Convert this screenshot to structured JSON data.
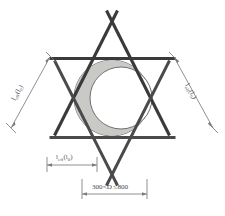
{
  "figure": {
    "background_color": "#ffffff",
    "rod_color": "#3a3a3c",
    "pipe_outline_color": "#6d6d70",
    "crescent_fill_color": "#c9c9c6",
    "dimension_color": "#7c7c80"
  },
  "labels": {
    "left": {
      "main": "l",
      "sub1": "eff",
      "paren_open": "(l",
      "sub2": "0",
      "paren_close": ")",
      "full": "l_eff (l_0)"
    },
    "right": {
      "main": "l",
      "sub1": "eff",
      "paren_open": "(l",
      "sub2": "0",
      "paren_close": ")",
      "full": "l_eff (l_0)"
    },
    "bottom_inner": {
      "main": "l",
      "sub1": "eff",
      "paren_open": "(l",
      "sub2": "0",
      "paren_close": ")",
      "full": "l_eff (l_0)"
    },
    "bottom_outer": {
      "full": "300<D ≤800",
      "min": "300",
      "op1": "<",
      "symbol": "D",
      "op2": "≤",
      "max": "800"
    }
  },
  "geometry": {
    "star_points": 6,
    "center_x": 112,
    "center_y": 103,
    "pipe_outer_radius": 38,
    "pipe_inner_radius": 30
  }
}
